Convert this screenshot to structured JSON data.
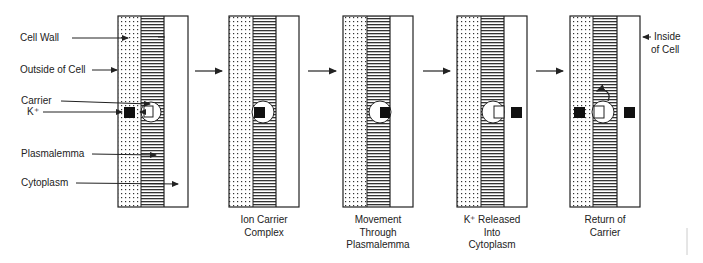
{
  "diagram": {
    "type": "process-sequence",
    "left_labels": [
      {
        "text": "Cell Wall",
        "points_to": "cell-wall"
      },
      {
        "text": "Outside of Cell",
        "points_to": "outside-of-cell"
      },
      {
        "text": "Carrier",
        "points_to": "carrier"
      },
      {
        "text": "K⁺",
        "points_to": "k-ion"
      },
      {
        "text": "Plasmalemma",
        "points_to": "plasmalemma"
      },
      {
        "text": "Cytoplasm",
        "points_to": "cytoplasm"
      }
    ],
    "right_label": {
      "line1": "Inside",
      "line2": "of Cell"
    },
    "steps": [
      {
        "caption": ""
      },
      {
        "caption_lines": [
          "Ion Carrier",
          "Complex"
        ]
      },
      {
        "caption_lines": [
          "Movement",
          "Through",
          "Plasmalemma"
        ]
      },
      {
        "caption_lines": [
          "K⁺ Released",
          "Into",
          "Cytoplasm"
        ]
      },
      {
        "caption_lines": [
          "Return of",
          "Carrier"
        ]
      }
    ],
    "colors": {
      "ink": "#222222",
      "background": "#ffffff"
    }
  }
}
